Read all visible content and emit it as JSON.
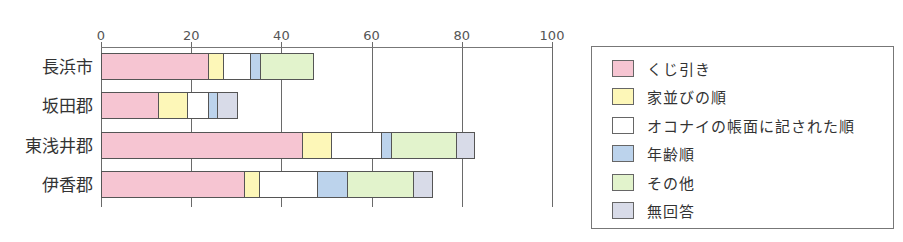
{
  "chart_data": {
    "type": "bar",
    "orientation": "horizontal",
    "stacked": true,
    "title": "",
    "xlabel": "",
    "ylabel": "",
    "xlim": [
      0,
      100
    ],
    "x_ticks": [
      "0",
      "20",
      "40",
      "60",
      "80",
      "100"
    ],
    "grid": true,
    "legend_position": "right",
    "categories": [
      "長浜市",
      "坂田郡",
      "東浅井郡",
      "伊香郡"
    ],
    "series": [
      {
        "name": "くじ引き",
        "color": "#f6c5d2",
        "values": [
          23.7,
          12.6,
          44.6,
          31.7
        ]
      },
      {
        "name": "家並びの順",
        "color": "#fdf7b8",
        "values": [
          3.3,
          6.4,
          6.4,
          3.3
        ]
      },
      {
        "name": "オコナイの帳面に記された順",
        "color": "#ffffff",
        "values": [
          6.0,
          4.7,
          11.1,
          12.9
        ]
      },
      {
        "name": "年齢順",
        "color": "#bcd3ec",
        "values": [
          2.2,
          2.0,
          2.2,
          6.7
        ]
      },
      {
        "name": "その他",
        "color": "#e2f3cc",
        "values": [
          11.8,
          0,
          14.4,
          14.6
        ]
      },
      {
        "name": "無回答",
        "color": "#d8dbe8",
        "values": [
          0,
          4.4,
          4.0,
          4.2
        ]
      }
    ]
  },
  "axis": {
    "ticks": [
      {
        "label": "0",
        "value": 0
      },
      {
        "label": "20",
        "value": 20
      },
      {
        "label": "40",
        "value": 40
      },
      {
        "label": "60",
        "value": 60
      },
      {
        "label": "80",
        "value": 80
      },
      {
        "label": "100",
        "value": 100
      }
    ]
  },
  "categories": [
    "長浜市",
    "坂田郡",
    "東浅井郡",
    "伊香郡"
  ],
  "legend": {
    "items": [
      {
        "label": "くじ引き",
        "color": "#f6c5d2"
      },
      {
        "label": "家並びの順",
        "color": "#fdf7b8"
      },
      {
        "label": "オコナイの帳面に記された順",
        "color": "#ffffff"
      },
      {
        "label": "年齢順",
        "color": "#bcd3ec"
      },
      {
        "label": "その他",
        "color": "#e2f3cc"
      },
      {
        "label": "無回答",
        "color": "#d8dbe8"
      }
    ]
  }
}
